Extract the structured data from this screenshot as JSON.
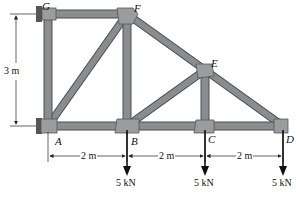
{
  "diagram": {
    "type": "truss",
    "colors": {
      "member": "#8a8d8f",
      "member_edge": "#4a4c4e",
      "gusset": "#9a9c9e",
      "support": "#555555",
      "line": "#222222"
    },
    "nodes": [
      {
        "id": "G",
        "label": "G"
      },
      {
        "id": "F",
        "label": "F"
      },
      {
        "id": "E",
        "label": "E"
      },
      {
        "id": "A",
        "label": "A"
      },
      {
        "id": "B",
        "label": "B"
      },
      {
        "id": "C",
        "label": "C"
      },
      {
        "id": "D",
        "label": "D"
      }
    ],
    "members": [
      "G-F",
      "G-A",
      "A-F",
      "F-B",
      "F-E",
      "E-D",
      "E-B",
      "E-C",
      "A-B",
      "B-C",
      "C-D"
    ],
    "supports": [
      {
        "node": "G",
        "type": "pin-wall"
      },
      {
        "node": "A",
        "type": "roller-wall"
      }
    ],
    "dimensions": {
      "height": "3 m",
      "spans": [
        "2 m",
        "2 m",
        "2 m"
      ]
    },
    "loads": [
      {
        "node": "B",
        "label": "5 kN"
      },
      {
        "node": "C",
        "label": "5 kN"
      },
      {
        "node": "D",
        "label": "5 kN"
      }
    ]
  }
}
